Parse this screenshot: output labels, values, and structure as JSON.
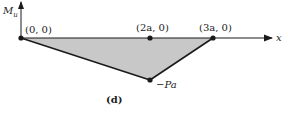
{
  "diagram": {
    "y_axis_label": "M_u",
    "y_axis_label_main": "M",
    "y_axis_label_sub": "u",
    "x_axis_label": "x",
    "points": [
      {
        "id": "origin",
        "label": "(0, 0)",
        "x": 0,
        "y": 0
      },
      {
        "id": "mid",
        "label": "(2a, 0)",
        "x": 2,
        "y": 0
      },
      {
        "id": "end",
        "label": "(3a, 0)",
        "x": 3,
        "y": 0
      },
      {
        "id": "min",
        "label": "−Pa",
        "x": 2,
        "y": -1
      }
    ],
    "caption": "(d)",
    "fill_color": "#c8c8c8",
    "line_color": "#1a1a1a"
  }
}
